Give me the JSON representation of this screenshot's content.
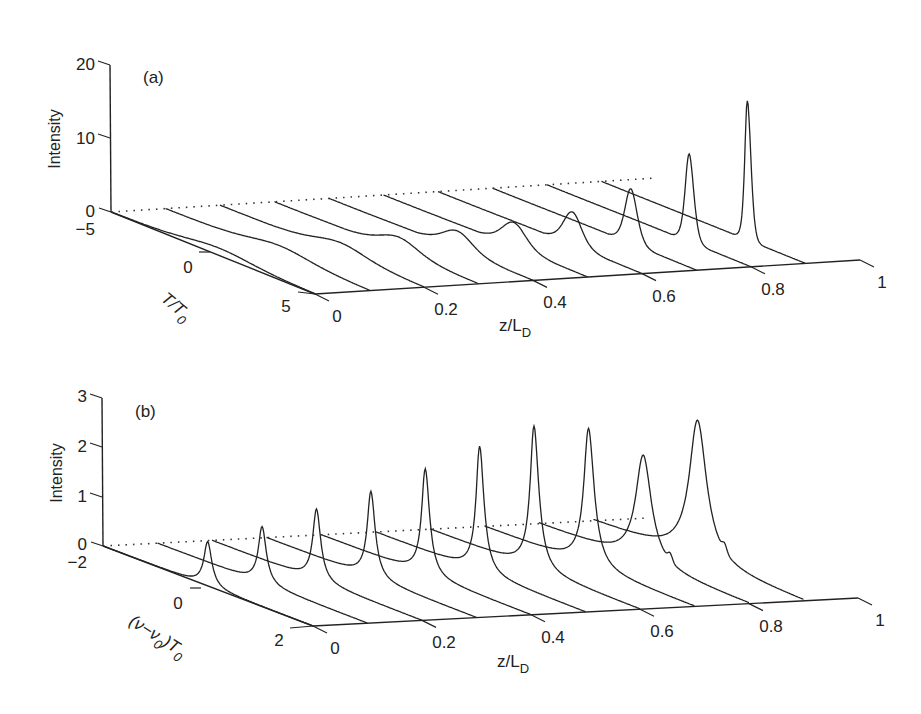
{
  "chart_data": [
    {
      "id": "a",
      "type": "waterfall-3d-line",
      "panel_label": "(a)",
      "title": "",
      "zlabel": "Intensity",
      "xlabel": "z/L_D",
      "ylabel": "T/T_0",
      "z_ticks": [
        "0",
        "10",
        "20"
      ],
      "zlim": [
        0,
        20
      ],
      "x_ticks": [
        "0",
        "0.2",
        "0.4",
        "0.6",
        "0.8",
        "1"
      ],
      "xlim": [
        0,
        1
      ],
      "y_ticks": [
        "-5",
        "0",
        "5"
      ],
      "ylim": [
        -5,
        5
      ],
      "grid": false,
      "series": [
        {
          "z": 0.0,
          "peak": 1.0,
          "width": 2.2,
          "center": 0.3
        },
        {
          "z": 0.1,
          "peak": 1.2,
          "width": 2.0,
          "center": 0.6
        },
        {
          "z": 0.2,
          "peak": 1.5,
          "width": 1.7,
          "center": 0.9
        },
        {
          "z": 0.3,
          "peak": 2.0,
          "width": 1.3,
          "center": 1.1
        },
        {
          "z": 0.4,
          "peak": 2.6,
          "width": 1.0,
          "center": 1.3
        },
        {
          "z": 0.5,
          "peak": 3.4,
          "width": 0.8,
          "center": 1.4
        },
        {
          "z": 0.6,
          "peak": 4.6,
          "width": 0.6,
          "center": 1.6
        },
        {
          "z": 0.7,
          "peak": 7.5,
          "width": 0.4,
          "center": 1.8
        },
        {
          "z": 0.8,
          "peak": 12.0,
          "width": 0.28,
          "center": 2.0
        },
        {
          "z": 0.9,
          "peak": 19.0,
          "width": 0.2,
          "center": 2.2
        }
      ]
    },
    {
      "id": "b",
      "type": "waterfall-3d-line",
      "panel_label": "(b)",
      "title": "",
      "zlabel": "Intensity",
      "xlabel": "z/L_D",
      "ylabel": "(ν−ν_0)T_0",
      "z_ticks": [
        "0",
        "1",
        "2",
        "3"
      ],
      "zlim": [
        0,
        3
      ],
      "x_ticks": [
        "0",
        "0.2",
        "0.4",
        "0.6",
        "0.8",
        "1"
      ],
      "xlim": [
        0,
        1
      ],
      "y_ticks": [
        "-2",
        "0",
        "2"
      ],
      "ylim": [
        -2,
        2
      ],
      "grid": false,
      "series": [
        {
          "z": 0.0,
          "peak": 0.9,
          "width": 0.1,
          "center": 0.0
        },
        {
          "z": 0.1,
          "peak": 1.15,
          "width": 0.1,
          "center": 0.0
        },
        {
          "z": 0.2,
          "peak": 1.45,
          "width": 0.1,
          "center": 0.0
        },
        {
          "z": 0.3,
          "peak": 1.75,
          "width": 0.1,
          "center": 0.0
        },
        {
          "z": 0.4,
          "peak": 2.15,
          "width": 0.1,
          "center": 0.0
        },
        {
          "z": 0.5,
          "peak": 2.55,
          "width": 0.1,
          "center": 0.0
        },
        {
          "z": 0.6,
          "peak": 2.9,
          "width": 0.11,
          "center": 0.0
        },
        {
          "z": 0.7,
          "peak": 2.8,
          "width": 0.13,
          "center": 0.0
        },
        {
          "z": 0.8,
          "peak": 2.2,
          "width": 0.2,
          "center": 0.0
        },
        {
          "z": 0.9,
          "peak": 2.85,
          "width": 0.22,
          "center": 0.0
        }
      ]
    }
  ],
  "panels": {
    "a": {
      "label": "(a)",
      "zlabel": "Intensity",
      "xlabel_main": "z/L",
      "xlabel_sub": "D",
      "ylabel_main": "T/T",
      "ylabel_sub": "0",
      "z_ticks": [
        "20",
        "10",
        "0"
      ],
      "y_ticks": [
        "−5",
        "0",
        "5"
      ],
      "x_ticks": [
        "0",
        "0.2",
        "0.4",
        "0.6",
        "0.8",
        "1"
      ]
    },
    "b": {
      "label": "(b)",
      "zlabel": "Intensity",
      "xlabel_main": "z/L",
      "xlabel_sub": "D",
      "ylabel_main": "(ν−ν",
      "ylabel_sub1": "0",
      "ylabel_mid": ")T",
      "ylabel_sub2": "0",
      "z_ticks": [
        "3",
        "2",
        "1",
        "0"
      ],
      "y_ticks": [
        "−2",
        "0",
        "2"
      ],
      "x_ticks": [
        "0",
        "0.2",
        "0.4",
        "0.6",
        "0.8",
        "1"
      ]
    }
  }
}
